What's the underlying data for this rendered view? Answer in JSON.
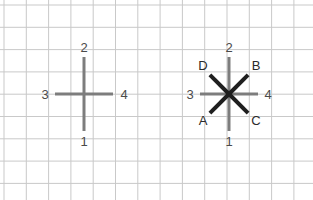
{
  "figure": {
    "title": "",
    "canvas": {
      "width": 313,
      "height": 200,
      "background": "#ffffff"
    },
    "grid": {
      "spacing": 22.3,
      "color": "#c9c9c9",
      "minor_color": "#e4e4e4",
      "line_width": 1,
      "visible": true,
      "x_origin": 4,
      "y_origin": 5,
      "columns": 14,
      "rows": 9
    },
    "colors": {
      "axis_cross": "#7d7d7d",
      "diagonal_arm": "#1f1f1f",
      "number_label": "#4a4a4a",
      "letter_label": "#2b2b2b",
      "grid_line": "#c9c9c9"
    },
    "diagrams": [
      {
        "id": "left-cross",
        "name": "four-direction-cross",
        "center": {
          "x": 84,
          "y": 94
        },
        "arms": [
          {
            "id": "up",
            "label": "2",
            "angle_deg": 90,
            "length": 37,
            "color": "#7d7d7d",
            "thickness": 3,
            "label_pos": {
              "x": 84,
              "y": 47
            }
          },
          {
            "id": "down",
            "label": "1",
            "angle_deg": 270,
            "length": 37,
            "color": "#7d7d7d",
            "thickness": 3,
            "label_pos": {
              "x": 84,
              "y": 141
            }
          },
          {
            "id": "left",
            "label": "3",
            "angle_deg": 180,
            "length": 29,
            "color": "#7d7d7d",
            "thickness": 3,
            "label_pos": {
              "x": 45,
              "y": 94
            }
          },
          {
            "id": "right",
            "label": "4",
            "angle_deg": 0,
            "length": 29,
            "color": "#7d7d7d",
            "thickness": 3,
            "label_pos": {
              "x": 124,
              "y": 94
            }
          }
        ]
      },
      {
        "id": "right-star",
        "name": "eight-direction-star",
        "center": {
          "x": 229,
          "y": 94
        },
        "arms": [
          {
            "id": "up",
            "label": "2",
            "angle_deg": 90,
            "length": 37,
            "color": "#7d7d7d",
            "thickness": 3,
            "label_pos": {
              "x": 229,
              "y": 47
            }
          },
          {
            "id": "down",
            "label": "1",
            "angle_deg": 270,
            "length": 37,
            "color": "#7d7d7d",
            "thickness": 3,
            "label_pos": {
              "x": 229,
              "y": 141
            }
          },
          {
            "id": "left",
            "label": "3",
            "angle_deg": 180,
            "length": 29,
            "color": "#7d7d7d",
            "thickness": 3,
            "label_pos": {
              "x": 190,
              "y": 94
            }
          },
          {
            "id": "right",
            "label": "4",
            "angle_deg": 0,
            "length": 29,
            "color": "#7d7d7d",
            "thickness": 3,
            "label_pos": {
              "x": 268,
              "y": 94
            }
          },
          {
            "id": "up-left",
            "label": "D",
            "angle_deg": 135,
            "length": 27,
            "color": "#1f1f1f",
            "thickness": 4,
            "label_pos": {
              "x": 203,
              "y": 65
            }
          },
          {
            "id": "up-right",
            "label": "B",
            "angle_deg": 45,
            "length": 27,
            "color": "#1f1f1f",
            "thickness": 4,
            "label_pos": {
              "x": 256,
              "y": 65
            }
          },
          {
            "id": "down-left",
            "label": "A",
            "angle_deg": 225,
            "length": 27,
            "color": "#1f1f1f",
            "thickness": 4,
            "label_pos": {
              "x": 203,
              "y": 120
            }
          },
          {
            "id": "down-right",
            "label": "C",
            "angle_deg": 315,
            "length": 27,
            "color": "#1f1f1f",
            "thickness": 4,
            "label_pos": {
              "x": 256,
              "y": 120
            }
          }
        ]
      }
    ]
  }
}
